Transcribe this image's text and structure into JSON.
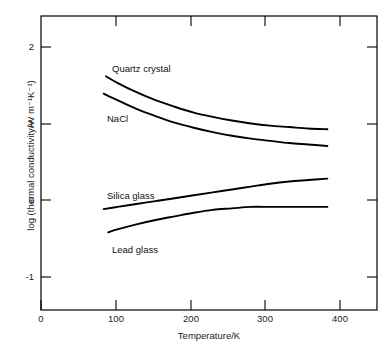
{
  "chart_data": {
    "type": "line",
    "title": "",
    "xlabel": "Temperature/K",
    "ylabel": "log (thermal conductivity/W m⁻¹K⁻¹)",
    "xlim": [
      0,
      440
    ],
    "ylim": [
      -1.55,
      2.5
    ],
    "xticks": [
      0,
      100,
      200,
      300,
      400
    ],
    "xtick_labels": [
      "0",
      "100",
      "200",
      "300",
      "400"
    ],
    "yticks": [
      -1,
      0,
      1,
      2
    ],
    "ytick_labels": [
      "-1",
      "0",
      "1",
      "2"
    ],
    "grid": false,
    "legend": "inline-curve-labels",
    "series": [
      {
        "name": "Quartz crystal",
        "label": "Quartz crystal",
        "color": "#000000",
        "x": [
          85,
          100,
          125,
          150,
          175,
          200,
          225,
          250,
          275,
          300,
          325,
          350,
          375
        ],
        "y": [
          1.67,
          1.58,
          1.45,
          1.34,
          1.25,
          1.17,
          1.11,
          1.06,
          1.02,
          0.99,
          0.97,
          0.95,
          0.94
        ]
      },
      {
        "name": "NaCl",
        "label": "NaCl",
        "color": "#000000",
        "x": [
          82,
          100,
          125,
          150,
          175,
          200,
          225,
          250,
          275,
          300,
          325,
          350,
          375
        ],
        "y": [
          1.43,
          1.34,
          1.22,
          1.12,
          1.03,
          0.96,
          0.9,
          0.85,
          0.81,
          0.78,
          0.75,
          0.73,
          0.71
        ]
      },
      {
        "name": "Silica glass",
        "label": "Silica glass",
        "color": "#000000",
        "x": [
          82,
          100,
          125,
          150,
          175,
          200,
          225,
          250,
          275,
          300,
          325,
          350,
          375
        ],
        "y": [
          -0.16,
          -0.13,
          -0.09,
          -0.05,
          -0.01,
          0.03,
          0.07,
          0.11,
          0.15,
          0.19,
          0.22,
          0.24,
          0.26
        ]
      },
      {
        "name": "Lead glass",
        "label": "Lead glass",
        "color": "#000000",
        "x": [
          88,
          100,
          125,
          150,
          175,
          200,
          225,
          250,
          275,
          300,
          325,
          350,
          375
        ],
        "y": [
          -0.48,
          -0.44,
          -0.37,
          -0.31,
          -0.26,
          -0.21,
          -0.17,
          -0.15,
          -0.13,
          -0.13,
          -0.13,
          -0.13,
          -0.13
        ]
      }
    ],
    "annotations": [
      {
        "text": "Quartz crystal",
        "x": 110,
        "y": 1.62
      },
      {
        "text": "NaCl",
        "x": 105,
        "y": 1.22
      },
      {
        "text": "Silica glass",
        "x": 105,
        "y": 0.08
      },
      {
        "text": "Lead glass",
        "x": 110,
        "y": -0.53
      }
    ]
  },
  "axes": {
    "x_title": "Temperature/K",
    "y_title": "log (thermal conductivity/W m⁻¹K⁻¹)",
    "x_tick_labels": [
      "0",
      "100",
      "200",
      "300",
      "400"
    ],
    "y_tick_labels": [
      "2",
      "1",
      "0",
      "-1"
    ]
  },
  "curve_labels": {
    "quartz": "Quartz crystal",
    "nacl": "NaCl",
    "silica": "Silica glass",
    "lead": "Lead glass"
  }
}
